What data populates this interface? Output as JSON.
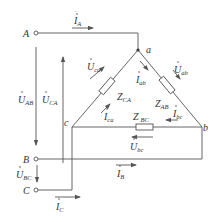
{
  "colors": {
    "line": "#555555",
    "text": "#333333",
    "background": "#ffffff"
  },
  "terminals": [
    {
      "id": "A",
      "label": "A"
    },
    {
      "id": "B",
      "label": "B"
    },
    {
      "id": "C",
      "label": "C"
    }
  ],
  "nodes": [
    {
      "id": "a",
      "label": "a"
    },
    {
      "id": "b",
      "label": "b"
    },
    {
      "id": "c",
      "label": "c"
    }
  ],
  "impedances": [
    {
      "id": "Z_CA",
      "symbol": "Z",
      "sub": "CA"
    },
    {
      "id": "Z_AB",
      "symbol": "Z",
      "sub": "AB"
    },
    {
      "id": "Z_BC",
      "symbol": "Z",
      "sub": "BC"
    }
  ],
  "line_currents": [
    {
      "id": "I_A",
      "symbol": "I",
      "sub": "A"
    },
    {
      "id": "I_B",
      "symbol": "I",
      "sub": "B"
    },
    {
      "id": "I_C",
      "symbol": "I",
      "sub": "C"
    }
  ],
  "phase_currents": [
    {
      "id": "I_ab",
      "symbol": "I",
      "sub": "ab"
    },
    {
      "id": "I_bc",
      "symbol": "I",
      "sub": "bc"
    },
    {
      "id": "I_ca",
      "symbol": "I",
      "sub": "ca"
    }
  ],
  "line_voltages": [
    {
      "id": "U_AB",
      "symbol": "U",
      "sub": "AB"
    },
    {
      "id": "U_BC",
      "symbol": "U",
      "sub": "BC"
    },
    {
      "id": "U_CA",
      "symbol": "U",
      "sub": "CA"
    }
  ],
  "phase_voltages": [
    {
      "id": "U_ab",
      "symbol": "U",
      "sub": "ab"
    },
    {
      "id": "U_bc",
      "symbol": "U",
      "sub": "bc"
    },
    {
      "id": "U_ca",
      "symbol": "U",
      "sub": "ca"
    }
  ]
}
